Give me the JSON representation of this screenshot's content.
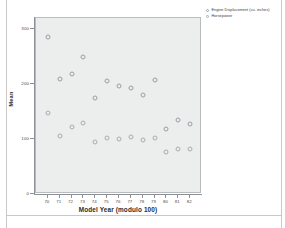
{
  "chart_data": {
    "type": "scatter",
    "title": "",
    "xlabel": "Model Year (modulo 100)",
    "ylabel": "Mean",
    "xlim": [
      69,
      83
    ],
    "ylim": [
      0,
      320
    ],
    "xticks": [
      "70",
      "71",
      "72",
      "73",
      "74",
      "75",
      "76",
      "77",
      "78",
      "79",
      "80",
      "81",
      "82"
    ],
    "yticks": [
      "0",
      "100",
      "200",
      "300"
    ],
    "grid": false,
    "legend_position": "top-right",
    "x": [
      70,
      71,
      72,
      73,
      74,
      75,
      76,
      77,
      78,
      79,
      80,
      81,
      82
    ],
    "series": [
      {
        "name": "Engine Displacement (cu. inches)",
        "marker": "open-circle",
        "color": "#9aa0a6",
        "values": [
          285,
          210,
          218,
          250,
          175,
          205,
          197,
          192,
          180,
          207,
          118,
          135,
          128
        ]
      },
      {
        "name": "Horsepower",
        "marker": "open-circle",
        "color": "#a8adb2",
        "values": [
          147,
          105,
          121,
          130,
          95,
          101,
          100,
          103,
          99,
          101,
          77,
          81,
          82
        ]
      }
    ]
  },
  "legend": {
    "entries": [
      "Engine Displacement (cu. inches)",
      "Horsepower"
    ]
  }
}
